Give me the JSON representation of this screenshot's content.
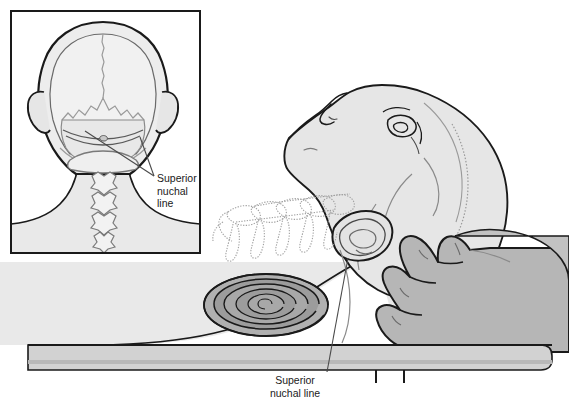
{
  "figure": {
    "background_color": "#ffffff"
  },
  "inset": {
    "name": "posterior-skull-view",
    "border_color": "#1a1a1a",
    "label": {
      "line1": "Superior",
      "line2": "nuchal",
      "line3": "line"
    }
  },
  "main": {
    "name": "lateral-supine-view",
    "label": {
      "line1": "Superior",
      "line2": "nuchal line"
    }
  },
  "parts": {
    "skull": "skull-outline",
    "cranial_sutures": "cranial-suture-lines",
    "ears": "ear-outline",
    "cervical_vertebrae": "cervical-vertebrae",
    "nuchal_lines": "superior-nuchal-line-marks",
    "patient_head": "patient-head",
    "patient_face": "patient-face-profile",
    "patient_ear": "patient-ear",
    "patient_torso": "patient-torso",
    "rolled_towel": "rolled-towel",
    "clinician_hand": "clinician-hand",
    "table": "examination-table",
    "table_legs": "table-legs",
    "leader_line_main": "leader-line",
    "leader_line_inset_upper": "leader-line-upper",
    "leader_line_inset_lower": "leader-line-lower"
  },
  "colors": {
    "outline": "#1a1a1a",
    "soft_line": "#8a8a8a",
    "faint_line": "#b5b5b5",
    "skin_light": "#e9e9e9",
    "skin_mid": "#dedede",
    "bone_light": "#ececec",
    "towel_light": "#b6b6b6",
    "towel_dark": "#9a9a9a",
    "hand": "#b8b8b8",
    "table": "#d4d4d4",
    "table_shadow": "#c4c4c4",
    "label_text": "#1a1a1a"
  }
}
